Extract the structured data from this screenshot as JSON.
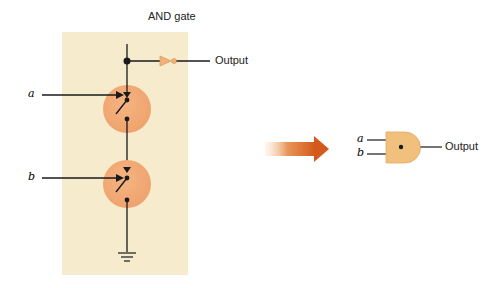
{
  "transistor_circuit": {
    "title": "AND gate",
    "output_label": "Output",
    "inputs": [
      {
        "label": "a"
      },
      {
        "label": "b"
      }
    ],
    "ground_icon": "ground-symbol"
  },
  "transform_arrow": {
    "icon": "arrow-right"
  },
  "gate_symbol": {
    "inputs": [
      {
        "label": "a"
      },
      {
        "label": "b"
      }
    ],
    "output_label": "Output"
  },
  "colors": {
    "panel": "#f7ebcd",
    "switch_fill": "#f2ab76",
    "gate_fill": "#f0c07c",
    "arrow": "#d85e1d",
    "line": "#1a1a1a"
  }
}
